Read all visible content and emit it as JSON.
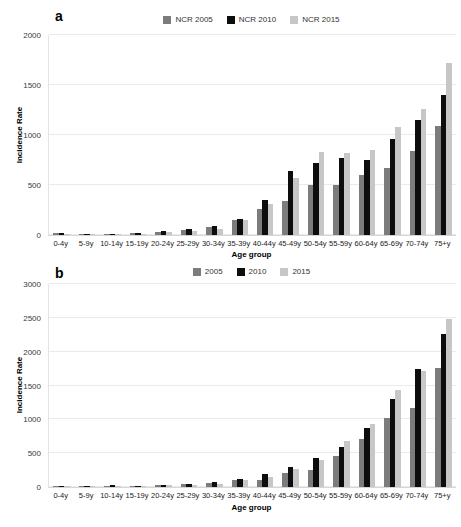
{
  "figure": {
    "panel_a_label": "a",
    "panel_b_label": "b"
  },
  "chart_data": [
    {
      "type": "bar",
      "panel": "a",
      "title": "",
      "xlabel": "Age group",
      "ylabel": "Incidence Rate",
      "ylim": [
        0,
        2000
      ],
      "yticks": [
        0,
        500,
        1000,
        1500,
        2000
      ],
      "grid": true,
      "legend_position": "top",
      "categories": [
        "0-4y",
        "5-9y",
        "10-14y",
        "15-19y",
        "20-24y",
        "25-29y",
        "30-34y",
        "35-39y",
        "40-44y",
        "45-49y",
        "50-54y",
        "55-59y",
        "60-64y",
        "65-69y",
        "70-74y",
        "75+y"
      ],
      "series": [
        {
          "name": "NCR 2005",
          "color": "#7c7c7c",
          "values": [
            20,
            12,
            14,
            16,
            28,
            50,
            78,
            150,
            260,
            340,
            500,
            500,
            600,
            670,
            845,
            1090
          ]
        },
        {
          "name": "NCR 2010",
          "color": "#0d0d0d",
          "values": [
            18,
            12,
            14,
            16,
            40,
            60,
            90,
            165,
            350,
            640,
            725,
            770,
            750,
            960,
            1150,
            1400
          ]
        },
        {
          "name": "NCR 2015",
          "color": "#c7c7c7",
          "values": [
            15,
            10,
            12,
            14,
            28,
            40,
            65,
            148,
            310,
            575,
            830,
            820,
            855,
            1080,
            1260,
            1720
          ]
        }
      ]
    },
    {
      "type": "bar",
      "panel": "b",
      "title": "",
      "xlabel": "Age group",
      "ylabel": "Incidence Rate",
      "ylim": [
        0,
        3000
      ],
      "yticks": [
        0,
        500,
        1000,
        1500,
        2000,
        2500,
        3000
      ],
      "grid": true,
      "legend_position": "top",
      "categories": [
        "0-4y",
        "5-9y",
        "10-14y",
        "15-19y",
        "20-24y",
        "25-29y",
        "30-34y",
        "35-39y",
        "40-44y",
        "45-49y",
        "50-54y",
        "55-59y",
        "60-64y",
        "65-69y",
        "70-74y",
        "75+y"
      ],
      "series": [
        {
          "name": "2005",
          "color": "#7c7c7c",
          "values": [
            20,
            12,
            22,
            18,
            30,
            42,
            65,
            105,
            100,
            205,
            255,
            455,
            710,
            1020,
            1165,
            1765
          ]
        },
        {
          "name": "2010",
          "color": "#0d0d0d",
          "values": [
            20,
            12,
            25,
            18,
            35,
            48,
            80,
            118,
            187,
            295,
            430,
            590,
            875,
            1305,
            1745,
            2260
          ]
        },
        {
          "name": "2015",
          "color": "#c7c7c7",
          "values": [
            15,
            10,
            18,
            15,
            25,
            35,
            48,
            100,
            145,
            260,
            405,
            685,
            925,
            1430,
            1720,
            2485
          ]
        }
      ]
    }
  ]
}
